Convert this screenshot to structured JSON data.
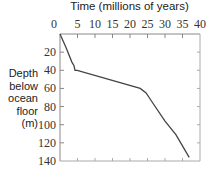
{
  "chart_data": {
    "type": "line",
    "title": "",
    "xlabel": "Time (millions of years)",
    "ylabel": "Depth below ocean floor (m)",
    "ylabel_lines": [
      "Depth",
      "below",
      "ocean",
      "floor",
      "(m)"
    ],
    "xlim": [
      0,
      40
    ],
    "ylim": [
      0,
      140
    ],
    "y_inverted": true,
    "x_axis_position": "top",
    "x_ticks": [
      0,
      5,
      10,
      15,
      20,
      25,
      30,
      35,
      40
    ],
    "y_ticks": [
      0,
      20,
      40,
      60,
      80,
      100,
      120,
      140
    ],
    "grid": false,
    "legend": null,
    "series": [
      {
        "name": "depth-age",
        "x": [
          0,
          1.7,
          3.4,
          4.0,
          4.3,
          4.9,
          22.9,
          24.6,
          26.3,
          30.0,
          33.1,
          36.9
        ],
        "y": [
          0,
          15,
          31,
          35,
          40,
          40,
          60,
          65,
          75,
          96,
          111,
          136
        ]
      }
    ],
    "line_color": "#444444"
  }
}
